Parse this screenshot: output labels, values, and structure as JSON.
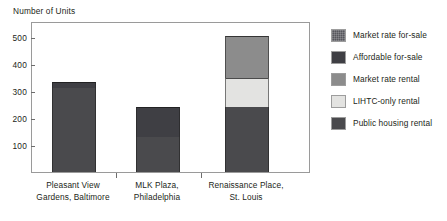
{
  "chart_data": {
    "type": "bar",
    "subtype": "stacked",
    "title": "",
    "xlabel": "",
    "ylabel": "Number of Units",
    "ylim": [
      0,
      560
    ],
    "yticks": [
      100,
      200,
      300,
      400,
      500
    ],
    "ytick_labels": [
      "100",
      "200",
      "300",
      "400",
      "500"
    ],
    "grid": false,
    "legend_position": "right",
    "categories": [
      "Pleasant View\nGardens, Baltimore",
      "MLK Plaza,\nPhiladelphia",
      "Renaissance Place,\nSt. Louis"
    ],
    "category_lines": [
      [
        "Pleasant View",
        "Gardens, Baltimore"
      ],
      [
        "MLK Plaza,",
        "Philadelphia"
      ],
      [
        "Renaissance Place,",
        "St. Louis"
      ]
    ],
    "series": [
      {
        "name": "Market rate for-sale",
        "color": "#56565c",
        "values": [
          0,
          0,
          0
        ]
      },
      {
        "name": "Affordable for-sale",
        "color": "#3f3f44",
        "values": [
          25,
          110,
          0
        ]
      },
      {
        "name": "Market rate rental",
        "color": "#8c8c8c",
        "values": [
          0,
          0,
          155
        ]
      },
      {
        "name": "LIHTC-only rental",
        "color": "#e3e3e1",
        "values": [
          0,
          0,
          110
        ]
      },
      {
        "name": "Public housing rental",
        "color": "#4a4a4d",
        "values": [
          310,
          130,
          240
        ]
      }
    ],
    "stack_order": [
      "Public housing rental",
      "LIHTC-only rental",
      "Market rate rental",
      "Affordable for-sale",
      "Market rate for-sale"
    ],
    "totals": [
      335,
      240,
      505
    ]
  },
  "legend": {
    "items": [
      {
        "label": "Market rate for-sale",
        "color": "#56565c",
        "pattern": "hatch"
      },
      {
        "label": "Affordable for-sale",
        "color": "#3f3f44",
        "pattern": "solid"
      },
      {
        "label": "Market rate rental",
        "color": "#8c8c8c",
        "pattern": "solid"
      },
      {
        "label": "LIHTC-only rental",
        "color": "#e3e3e1",
        "pattern": "solid"
      },
      {
        "label": "Public housing rental",
        "color": "#4a4a4d",
        "pattern": "solid"
      }
    ]
  },
  "colors": {
    "frame": "#9a9a9a",
    "text": "#231f20",
    "background": "#ffffff"
  }
}
